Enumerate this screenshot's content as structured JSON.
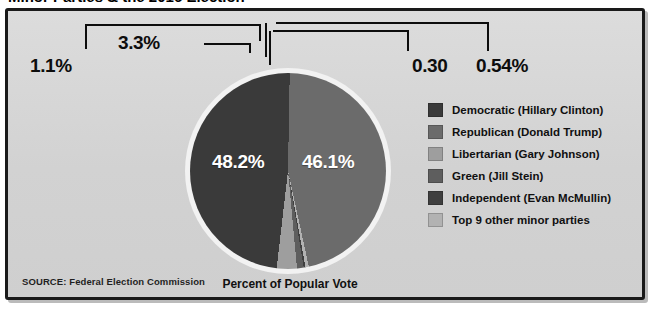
{
  "headline": {
    "text": "Minor Parties & the 2016 Election"
  },
  "panel": {
    "background": "#d4d4d4",
    "border_color": "#1a1a1a"
  },
  "caption": "Percent of Popular Vote",
  "source": "SOURCE: Federal Election Commission",
  "legend": {
    "items": [
      {
        "label": "Democratic (Hillary Clinton)",
        "color": "#3a3a3a"
      },
      {
        "label": "Republican (Donald Trump)",
        "color": "#6b6b6b"
      },
      {
        "label": "Libertarian (Gary Johnson)",
        "color": "#9e9e9e"
      },
      {
        "label": "Green (Jill Stein)",
        "color": "#5e5e5e"
      },
      {
        "label": "Independent (Evan McMullin)",
        "color": "#3f3f3f"
      },
      {
        "label": "Top 9 other minor parties",
        "color": "#b2b2b2"
      }
    ]
  },
  "callouts": [
    {
      "name": "callout-green",
      "label": "1.1%"
    },
    {
      "name": "callout-libertarian",
      "label": "3.3%"
    },
    {
      "name": "callout-independent",
      "label": "0.30"
    },
    {
      "name": "callout-other",
      "label": "0.54%"
    }
  ],
  "slice_labels": {
    "democratic": "48.2%",
    "republican": "46.1%"
  },
  "chart_data": {
    "type": "pie",
    "title": "Minor Parties & the 2016 Election",
    "subtitle": "Percent of Popular Vote",
    "xlabel": "",
    "ylabel": "Percent of Popular Vote",
    "source": "SOURCE: Federal Election Commission",
    "legend_position": "right",
    "grid": false,
    "value_unit": "percent",
    "categories": [
      "Democratic (Hillary Clinton)",
      "Republican (Donald Trump)",
      "Libertarian (Gary Johnson)",
      "Green (Jill Stein)",
      "Independent (Evan McMullin)",
      "Top 9 other minor parties"
    ],
    "values": [
      48.2,
      46.1,
      3.3,
      1.1,
      0.3,
      0.54
    ],
    "value_labels": [
      "48.2%",
      "46.1%",
      "3.3%",
      "1.1%",
      "0.30",
      "0.54%"
    ],
    "colors": [
      "#3a3a3a",
      "#6b6b6b",
      "#9e9e9e",
      "#5e5e5e",
      "#3f3f3f",
      "#b2b2b2"
    ]
  }
}
